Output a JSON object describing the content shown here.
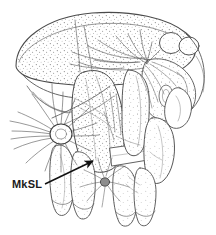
{
  "figure": {
    "domain": "scientific-line-drawing",
    "background_color": "#ffffff",
    "ink_color": "#4a4a4a",
    "dark_ink_color": "#1b1b1b",
    "stipple_color": "#6e6e6e",
    "width": 216,
    "height": 235
  },
  "annotations": {
    "labels": [
      {
        "id": "mksl",
        "text": "MkSL",
        "x": 12,
        "y": 187,
        "color": "#1b1b1b"
      }
    ],
    "leader_arrow": {
      "name": "mksl-leader-arrow",
      "from_x": 45,
      "from_y": 184,
      "to_x": 95,
      "to_y": 160,
      "color": "#111111",
      "head_size": 9
    }
  },
  "structures": {
    "dome": {
      "name": "dorsal-dome",
      "description": "large stippled dome-shaped body region occupying upper left",
      "shaded": true
    },
    "knobs": [
      {
        "name": "upper-right-knob-1",
        "cx": 171,
        "cy": 43,
        "rx": 11,
        "ry": 10
      },
      {
        "name": "upper-right-knob-2",
        "cx": 189,
        "cy": 46,
        "rx": 10,
        "ry": 9
      }
    ],
    "setal_tufts": [
      {
        "name": "mksl-setal-tuft",
        "cx": 61,
        "cy": 133,
        "rx": 11,
        "ry": 10,
        "ray_count": 17
      },
      {
        "name": "ventral-setal-tuft",
        "cx": 105,
        "cy": 181,
        "rx": 5,
        "ry": 5,
        "ray_count": 11
      }
    ],
    "legs": [
      {
        "name": "leg-left-anterior"
      },
      {
        "name": "leg-left-posterior"
      },
      {
        "name": "leg-middle-anterior"
      },
      {
        "name": "leg-middle-posterior"
      },
      {
        "name": "leg-right"
      }
    ]
  }
}
